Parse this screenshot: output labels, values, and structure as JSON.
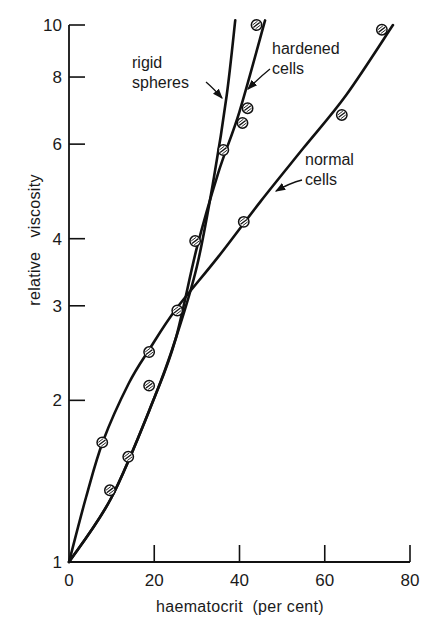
{
  "chart_data": {
    "type": "line",
    "title": "",
    "xlabel": "haematocrit (per cent)",
    "ylabel": "relative viscosity",
    "xlim": [
      0,
      80
    ],
    "ylim": [
      1,
      10
    ],
    "yscale": "log",
    "x_ticks": [
      0,
      20,
      40,
      60,
      80
    ],
    "y_ticks": [
      1,
      2,
      3,
      4,
      6,
      8,
      10
    ],
    "grid": false,
    "legend": "none (direct annotations with arrows)",
    "series": [
      {
        "name": "rigid spheres",
        "marker": "none",
        "curve": [
          [
            0,
            1.0
          ],
          [
            10,
            1.32
          ],
          [
            20,
            2.02
          ],
          [
            25,
            2.6
          ],
          [
            30,
            3.55
          ],
          [
            34,
            5.2
          ],
          [
            37,
            7.4
          ],
          [
            39,
            10.2
          ]
        ],
        "points": [
          [
            9.6,
            1.36
          ],
          [
            13.9,
            1.57
          ],
          [
            18.8,
            2.13
          ],
          [
            25.4,
            2.94
          ],
          [
            29.6,
            3.96
          ],
          [
            36.2,
            5.85
          ]
        ]
      },
      {
        "name": "hardened cells",
        "marker": "hatched circle",
        "curve": [
          [
            0,
            1.0
          ],
          [
            10,
            1.32
          ],
          [
            20,
            2.02
          ],
          [
            25,
            2.6
          ],
          [
            30,
            3.85
          ],
          [
            35,
            5.3
          ],
          [
            40,
            6.9
          ],
          [
            46,
            10.2
          ]
        ],
        "points": [
          [
            9.6,
            1.36
          ],
          [
            13.9,
            1.57
          ],
          [
            18.8,
            2.13
          ],
          [
            25.4,
            2.94
          ],
          [
            29.6,
            3.96
          ],
          [
            36.2,
            5.85
          ],
          [
            40.7,
            6.57
          ],
          [
            41.9,
            7.0
          ],
          [
            44.0,
            10.0
          ]
        ]
      },
      {
        "name": "normal cells",
        "marker": "hatched circle",
        "curve": [
          [
            0,
            1.0
          ],
          [
            4,
            1.32
          ],
          [
            8,
            1.68
          ],
          [
            14,
            2.15
          ],
          [
            19,
            2.5
          ],
          [
            25,
            2.95
          ],
          [
            35,
            3.7
          ],
          [
            45,
            4.7
          ],
          [
            55,
            5.9
          ],
          [
            65,
            7.4
          ],
          [
            76,
            10.0
          ]
        ],
        "points": [
          [
            7.8,
            1.67
          ],
          [
            18.8,
            2.46
          ],
          [
            25.4,
            2.94
          ],
          [
            41.0,
            4.3
          ],
          [
            64.0,
            6.8
          ],
          [
            73.4,
            9.8
          ]
        ]
      }
    ],
    "annotations": [
      {
        "text": [
          "rigid",
          "spheres"
        ],
        "points_to": "rigid spheres"
      },
      {
        "text": [
          "hardened",
          "cells"
        ],
        "points_to": "hardened cells"
      },
      {
        "text": [
          "normal",
          "cells"
        ],
        "points_to": "normal cells"
      }
    ]
  },
  "axes": {
    "x_tick_labels": [
      "0",
      "20",
      "40",
      "60",
      "80"
    ],
    "y_tick_labels": [
      "1",
      "2",
      "3",
      "4",
      "6",
      "8",
      "10"
    ],
    "xlabel": "haematocrit  (per cent)",
    "ylabel": "relative   viscosity"
  },
  "labels": {
    "rigid_1": "rigid",
    "rigid_2": "spheres",
    "hardened_1": "hardened",
    "hardened_2": "cells",
    "normal_1": "normal",
    "normal_2": "cells"
  }
}
